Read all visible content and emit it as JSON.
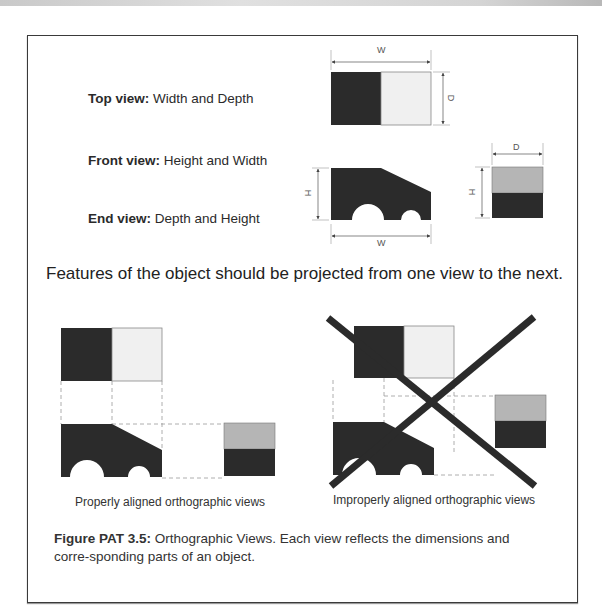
{
  "view_labels": [
    {
      "bold": "Top view:",
      "text": " Width and Depth"
    },
    {
      "bold": "Front view:",
      "text": " Height and Width"
    },
    {
      "bold": "End view:",
      "text": " Depth and Height"
    }
  ],
  "dimensions": {
    "top_width": "W",
    "top_depth": "D",
    "front_height": "H",
    "front_width": "W",
    "end_depth": "D",
    "end_height": "H"
  },
  "headline": "Features of the object should be projected from one view to the next.",
  "examples": {
    "proper_label": "Properly aligned orthographic views",
    "improper_label": "Improperly aligned orthographic views"
  },
  "caption": {
    "figure_label": "Figure PAT 3.5:",
    "text": "  Orthographic Views. Each view reflects the dimensions and corre-sponding parts of an object."
  },
  "colors": {
    "dark": "#2b2b2b",
    "light": "#f0f0f0",
    "mid_gray": "#b5b5b5",
    "dash": "#9a9a9a"
  }
}
